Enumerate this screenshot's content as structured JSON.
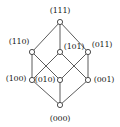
{
  "figure": {
    "background_color": "#ffffff",
    "edge_color": "#4a4a4a",
    "node_fill": "#ffffff",
    "node_stroke": "#3a3a3a",
    "label_color": "#1a1a1a"
  },
  "chart_data": {
    "type": "diagram",
    "title": "",
    "nodes": [
      {
        "id": "111",
        "label": "(111)",
        "x": 60,
        "y": 22,
        "rank": 3,
        "label_x": 60,
        "label_y": 10,
        "label_anchor": "above"
      },
      {
        "id": "110",
        "label": "(110)",
        "x": 32,
        "y": 52,
        "rank": 2,
        "label_x": 19,
        "label_y": 41,
        "label_anchor": "upper-left"
      },
      {
        "id": "101",
        "label": "(101)",
        "x": 60,
        "y": 52,
        "rank": 2,
        "label_x": 74,
        "label_y": 46,
        "label_anchor": "right"
      },
      {
        "id": "011",
        "label": "(011)",
        "x": 88,
        "y": 52,
        "rank": 2,
        "label_x": 102,
        "label_y": 44,
        "label_anchor": "upper-right"
      },
      {
        "id": "100",
        "label": "(100)",
        "x": 32,
        "y": 80,
        "rank": 1,
        "label_x": 16,
        "label_y": 78,
        "label_anchor": "left"
      },
      {
        "id": "010",
        "label": "(010)",
        "x": 60,
        "y": 80,
        "rank": 1,
        "label_x": 45,
        "label_y": 79,
        "label_anchor": "left"
      },
      {
        "id": "001",
        "label": "(001)",
        "x": 88,
        "y": 80,
        "rank": 1,
        "label_x": 104,
        "label_y": 79,
        "label_anchor": "right"
      },
      {
        "id": "000",
        "label": "(000)",
        "x": 60,
        "y": 105,
        "rank": 0,
        "label_x": 60,
        "label_y": 118,
        "label_anchor": "below"
      }
    ],
    "edges": [
      {
        "from": "111",
        "to": "110"
      },
      {
        "from": "111",
        "to": "101"
      },
      {
        "from": "111",
        "to": "011"
      },
      {
        "from": "110",
        "to": "100"
      },
      {
        "from": "110",
        "to": "010"
      },
      {
        "from": "101",
        "to": "100"
      },
      {
        "from": "101",
        "to": "001"
      },
      {
        "from": "011",
        "to": "010"
      },
      {
        "from": "011",
        "to": "001"
      },
      {
        "from": "100",
        "to": "000"
      },
      {
        "from": "010",
        "to": "000"
      },
      {
        "from": "001",
        "to": "000"
      }
    ],
    "node_radius": 2.6,
    "legend": [],
    "annotations": []
  }
}
